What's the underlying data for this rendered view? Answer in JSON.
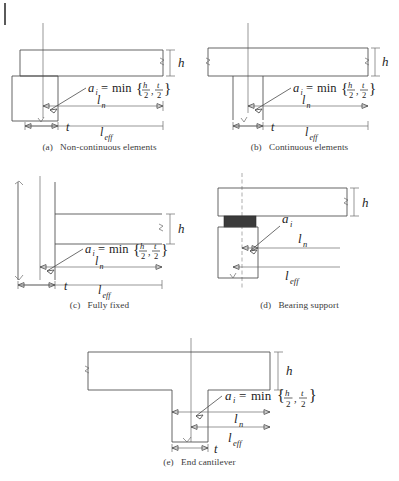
{
  "figure": {
    "type": "engineering-diagram",
    "background_color": "#ffffff",
    "line_color": "#4a4a4a",
    "pad_color": "#3b3b3b"
  },
  "symbols": {
    "a_i": "a",
    "a_sub": "i",
    "equals": "=",
    "min": "min",
    "brace_open": "{",
    "brace_close": "}",
    "comma": ",",
    "h": "h",
    "t": "t",
    "two": "2",
    "l": "l",
    "n": "n",
    "eff": "eff"
  },
  "formula_text": "a_i = min { h/2 , t/2 }",
  "panels": [
    {
      "id": "a",
      "caption": "(a)  Non-continuous elements",
      "caption_label": "(a)",
      "caption_text": "Non-continuous elements",
      "has_formula": true,
      "labels": {
        "h": "h",
        "t": "t",
        "ln": "l",
        "ln_sub": "n",
        "leff": "l",
        "leff_sub": "eff"
      },
      "support": "end-wall / non-continuous",
      "centerline": "solid"
    },
    {
      "id": "b",
      "caption": "(b)  Continuous elements",
      "caption_label": "(b)",
      "caption_text": "Continuous elements",
      "has_formula": true,
      "labels": {
        "h": "h",
        "t": "t",
        "ln": "l",
        "ln_sub": "n",
        "leff": "l",
        "leff_sub": "eff"
      },
      "support": "internal support / continuous",
      "centerline": "solid"
    },
    {
      "id": "c",
      "caption": "(c)  Fully fixed",
      "caption_label": "(c)",
      "caption_text": "Fully fixed",
      "has_formula": true,
      "labels": {
        "h": "h",
        "t": "t",
        "ln": "l",
        "ln_sub": "n",
        "leff": "l",
        "leff_sub": "eff"
      },
      "support": "fully fixed column",
      "centerline": "solid"
    },
    {
      "id": "d",
      "caption": "(d) Bearing support",
      "caption_label": "(d)",
      "caption_text": "Bearing support",
      "has_formula": false,
      "labels": {
        "h": "h",
        "ai": "a",
        "ai_sub": "i",
        "ln": "l",
        "ln_sub": "n",
        "leff": "l",
        "leff_sub": "eff"
      },
      "support": "bearing pad on support",
      "centerline": "dashed",
      "bearing_pad": true
    },
    {
      "id": "e",
      "caption": "(e)  End cantilever",
      "caption_label": "(e)",
      "caption_text": "End cantilever",
      "has_formula": true,
      "labels": {
        "h": "h",
        "t": "t",
        "ln": "l",
        "ln_sub": "n",
        "leff": "l",
        "leff_sub": "eff"
      },
      "support": "end cantilever over column",
      "centerline": "solid"
    }
  ]
}
